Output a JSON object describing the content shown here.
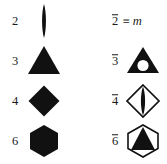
{
  "figure": {
    "kind": "crystallographic-symmetry-symbol-table",
    "background_color": "#ffffff",
    "ink_color": "#111111",
    "columns": 2,
    "rows": 4,
    "column_headers": [
      "rotation axes",
      "rotoinversion axes"
    ]
  },
  "rows": [
    {
      "left": {
        "label": "2",
        "symbol_name": "lens-two-fold-axis-symbol",
        "description": "filled lens (vesica) — twofold rotation axis"
      },
      "right": {
        "label_base": "2",
        "label_overbar": true,
        "equivalence_sign": "≡",
        "equivalent_to": "m",
        "symbol_name": "mirror-plane-equivalence-text",
        "description": "2-bar is equivalent to a mirror plane m"
      }
    },
    {
      "left": {
        "label": "3",
        "symbol_name": "filled-triangle-three-fold-axis-symbol",
        "description": "solid triangle — threefold rotation axis"
      },
      "right": {
        "label_base": "3",
        "label_overbar": true,
        "symbol_name": "filled-triangle-with-open-circle-three-bar-symbol",
        "description": "solid triangle with white circle — threefold rotoinversion axis"
      }
    },
    {
      "left": {
        "label": "4",
        "symbol_name": "filled-diamond-four-fold-axis-symbol",
        "description": "solid square on point — fourfold rotation axis"
      },
      "right": {
        "label_base": "4",
        "label_overbar": true,
        "symbol_name": "open-diamond-with-filled-lens-four-bar-symbol",
        "description": "open square on point containing solid lens — fourfold rotoinversion axis"
      }
    },
    {
      "left": {
        "label": "6",
        "symbol_name": "filled-hexagon-six-fold-axis-symbol",
        "description": "solid hexagon — sixfold rotation axis"
      },
      "right": {
        "label_base": "6",
        "label_overbar": true,
        "symbol_name": "open-hexagon-with-filled-triangle-six-bar-symbol",
        "description": "open hexagon containing solid triangle — sixfold rotoinversion axis"
      }
    }
  ]
}
